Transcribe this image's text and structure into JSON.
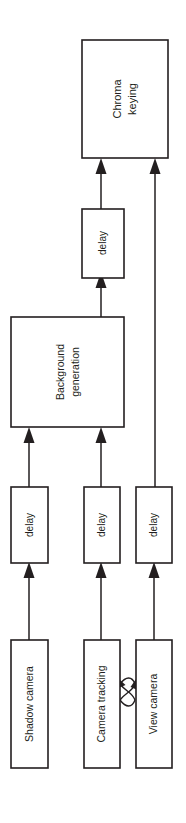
{
  "diagram": {
    "orientation": "rotated-90-ccw",
    "background_color": "#ffffff",
    "line_color": "#231f20",
    "nodes": {
      "chroma_keying": {
        "label_line1": "Chroma",
        "label_line2": "keying"
      },
      "delay_top": {
        "label": "delay"
      },
      "background_generation": {
        "label_line1": "Background",
        "label_line2": "generation"
      },
      "delay_left": {
        "label": "delay"
      },
      "delay_middle": {
        "label": "delay"
      },
      "delay_right": {
        "label": "delay"
      },
      "shadow_camera": {
        "label": "Shadow camera"
      },
      "camera_tracking": {
        "label": "Camera tracking"
      },
      "view_camera": {
        "label": "View camera"
      }
    },
    "edges": [
      {
        "from": "shadow_camera",
        "to": "delay_left",
        "type": "arrow"
      },
      {
        "from": "camera_tracking",
        "to": "delay_middle",
        "type": "arrow"
      },
      {
        "from": "view_camera",
        "to": "delay_right",
        "type": "arrow"
      },
      {
        "from": "delay_left",
        "to": "background_generation",
        "type": "arrow"
      },
      {
        "from": "delay_middle",
        "to": "background_generation",
        "type": "arrow"
      },
      {
        "from": "background_generation",
        "to": "delay_top",
        "type": "arrow"
      },
      {
        "from": "delay_top",
        "to": "chroma_keying",
        "type": "arrow"
      },
      {
        "from": "delay_right",
        "to": "chroma_keying",
        "type": "arrow"
      },
      {
        "from": "camera_tracking",
        "to": "view_camera",
        "type": "curved-bidirectional"
      }
    ]
  }
}
